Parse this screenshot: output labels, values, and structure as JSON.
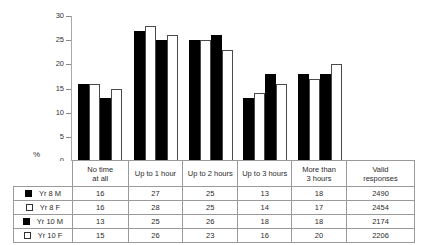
{
  "chart_data": {
    "type": "bar",
    "title": "",
    "subtitle": "",
    "xlabel": "",
    "ylabel": "%",
    "ylim": [
      0,
      30
    ],
    "yticks": [
      0,
      5,
      10,
      15,
      20,
      25,
      30
    ],
    "ytick_labels": [
      "0",
      "5",
      "10",
      "15",
      "20",
      "25",
      "30"
    ],
    "grid": false,
    "legend_position": "table-row-labels",
    "categories": [
      "No time at all",
      "Up to 1 hour",
      "Up to 2 hours",
      "Up to 3 hours",
      "More than 3 hours"
    ],
    "series": [
      {
        "name": "Yr 8 M",
        "marker": "filled",
        "values": [
          16,
          27,
          25,
          13,
          18
        ],
        "valid_responses": 2490
      },
      {
        "name": "Yr 8 F",
        "marker": "open",
        "values": [
          16,
          28,
          25,
          14,
          17
        ],
        "valid_responses": 2454
      },
      {
        "name": "Yr 10 M",
        "marker": "filled",
        "values": [
          13,
          25,
          26,
          18,
          18
        ],
        "valid_responses": 2174
      },
      {
        "name": "Yr 10 F",
        "marker": "open",
        "values": [
          15,
          26,
          23,
          16,
          20
        ],
        "valid_responses": 2206
      }
    ]
  },
  "table": {
    "corner_label": "",
    "column_headers": [
      {
        "line1": "No time",
        "line2": "at all"
      },
      {
        "line1": "Up to 1 hour",
        "line2": ""
      },
      {
        "line1": "Up to 2 hours",
        "line2": ""
      },
      {
        "line1": "Up to 3 hours",
        "line2": ""
      },
      {
        "line1": "More than",
        "line2": "3 hours"
      },
      {
        "line1": "Valid",
        "line2": "responses"
      }
    ],
    "rows": [
      {
        "label": "Yr 8 M",
        "marker": "filled",
        "cells": [
          "16",
          "27",
          "25",
          "13",
          "18",
          "2490"
        ]
      },
      {
        "label": "Yr 8 F",
        "marker": "open",
        "cells": [
          "16",
          "28",
          "25",
          "14",
          "17",
          "2454"
        ]
      },
      {
        "label": "Yr 10 M",
        "marker": "filled",
        "cells": [
          "13",
          "25",
          "26",
          "18",
          "18",
          "2174"
        ]
      },
      {
        "label": "Yr 10 F",
        "marker": "open",
        "cells": [
          "15",
          "26",
          "23",
          "16",
          "20",
          "2206"
        ]
      }
    ]
  },
  "axis": {
    "unit_label": "%"
  },
  "colors": {
    "filled_bar": "#000000",
    "open_bar_fill": "#ffffff",
    "open_bar_stroke": "#4a4a4a",
    "axis": "#a8a8a8",
    "grid_border": "#9a9a9a",
    "text": "#2b2b2b",
    "background": "#ffffff"
  }
}
